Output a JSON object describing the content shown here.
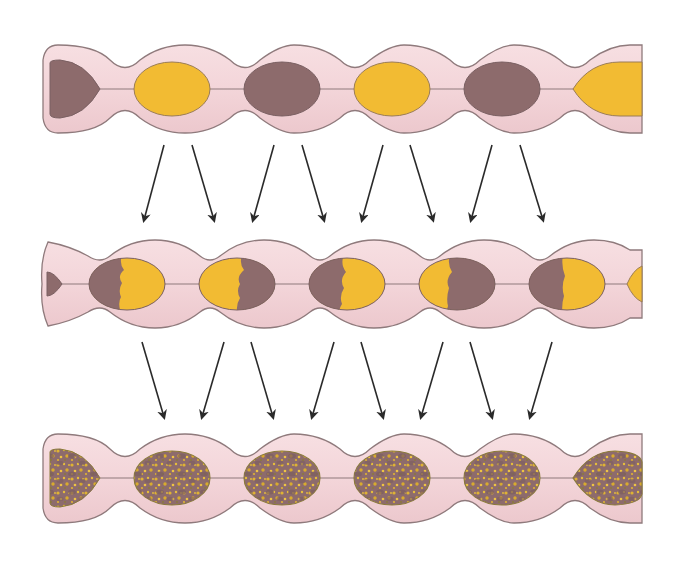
{
  "diagram": {
    "type": "three-stage segmented tube illustration",
    "colors": {
      "tube_fill": "#f3d6da",
      "tube_fill_light": "#fae8ea",
      "tube_outline": "#8f7a7c",
      "brown": "#8d6b6c",
      "yellow": "#f2bb33",
      "arrow": "#2a2a2a",
      "background": "#ffffff"
    },
    "rows": [
      {
        "name": "stage-1-separated",
        "center_y": 89,
        "segments": [
          "brown-cap",
          "yellow",
          "brown",
          "yellow",
          "brown",
          "yellow-partial"
        ]
      },
      {
        "name": "stage-2-half-mixed",
        "center_y": 284,
        "segments": [
          "brown-cap",
          "brown-left-yellow-right",
          "yellow-left-brown-right",
          "brown-left-yellow-right",
          "yellow-left-brown-right",
          "brown-left-yellow-right",
          "yellow-partial"
        ]
      },
      {
        "name": "stage-3-fully-mixed",
        "center_y": 478,
        "segments": [
          "mixed-cap",
          "mixed",
          "mixed",
          "mixed",
          "mixed",
          "mixed"
        ]
      }
    ],
    "arrow_rows": [
      {
        "name": "arrows-stage-1-to-2",
        "arrows": [
          {
            "x1": 164,
            "y1": 145,
            "x2": 144,
            "y2": 220
          },
          {
            "x1": 192,
            "y1": 145,
            "x2": 214,
            "y2": 220
          },
          {
            "x1": 274,
            "y1": 145,
            "x2": 253,
            "y2": 220
          },
          {
            "x1": 302,
            "y1": 145,
            "x2": 324,
            "y2": 220
          },
          {
            "x1": 383,
            "y1": 145,
            "x2": 362,
            "y2": 220
          },
          {
            "x1": 410,
            "y1": 145,
            "x2": 433,
            "y2": 220
          },
          {
            "x1": 492,
            "y1": 145,
            "x2": 471,
            "y2": 220
          },
          {
            "x1": 520,
            "y1": 145,
            "x2": 543,
            "y2": 220
          }
        ]
      },
      {
        "name": "arrows-stage-2-to-3",
        "arrows": [
          {
            "x1": 142,
            "y1": 342,
            "x2": 164,
            "y2": 417
          },
          {
            "x1": 224,
            "y1": 342,
            "x2": 202,
            "y2": 417
          },
          {
            "x1": 251,
            "y1": 342,
            "x2": 273,
            "y2": 417
          },
          {
            "x1": 334,
            "y1": 342,
            "x2": 312,
            "y2": 417
          },
          {
            "x1": 361,
            "y1": 342,
            "x2": 383,
            "y2": 417
          },
          {
            "x1": 443,
            "y1": 342,
            "x2": 421,
            "y2": 417
          },
          {
            "x1": 470,
            "y1": 342,
            "x2": 492,
            "y2": 417
          },
          {
            "x1": 552,
            "y1": 342,
            "x2": 530,
            "y2": 417
          }
        ]
      }
    ]
  }
}
